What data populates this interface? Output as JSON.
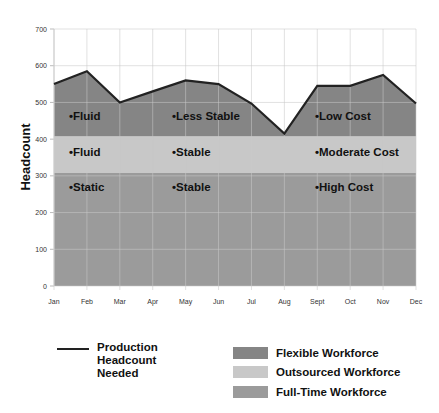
{
  "chart_data": {
    "type": "area",
    "title": "",
    "xlabel": "",
    "ylabel": "Headcount",
    "ylim": [
      0,
      700
    ],
    "yticks": [
      0,
      100,
      200,
      300,
      400,
      500,
      600,
      700
    ],
    "grid": true,
    "categories": [
      "Jan",
      "Feb",
      "Mar",
      "Apr",
      "May",
      "Jun",
      "Jul",
      "Aug",
      "Sept",
      "Oct",
      "Nov",
      "Dec"
    ],
    "series": [
      {
        "name": "Production Headcount Needed",
        "kind": "line",
        "color": "#222222",
        "values": [
          550,
          585,
          500,
          530,
          560,
          550,
          497,
          415,
          545,
          545,
          575,
          497
        ]
      },
      {
        "name": "Flexible Workforce",
        "kind": "area",
        "color": "#858585",
        "values": [
          550,
          585,
          500,
          530,
          560,
          550,
          497,
          415,
          545,
          545,
          575,
          497
        ],
        "base": 408
      },
      {
        "name": "Outsourced Workforce",
        "kind": "band",
        "color": "#c8c8c8",
        "from": 308,
        "to": 408
      },
      {
        "name": "Full-Time Workforce",
        "kind": "band",
        "color": "#9b9b9b",
        "from": 0,
        "to": 308
      }
    ],
    "annotations": [
      {
        "band": "Flexible Workforce",
        "labels": [
          "Fluid",
          "Less Stable",
          "Low Cost"
        ]
      },
      {
        "band": "Outsourced Workforce",
        "labels": [
          "Fluid",
          "Stable",
          "Moderate Cost"
        ]
      },
      {
        "band": "Full-Time Workforce",
        "labels": [
          "Static",
          "Stable",
          "High Cost"
        ]
      }
    ],
    "legend": {
      "position": "bottom",
      "line_item": "Production Headcount Needed",
      "line_item_lines": [
        "Production",
        "Headcount",
        "Needed"
      ],
      "swatch_items": [
        "Flexible Workforce",
        "Outsourced Workforce",
        "Full-Time Workforce"
      ]
    }
  }
}
